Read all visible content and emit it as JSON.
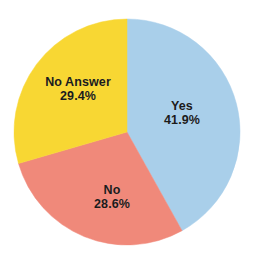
{
  "chart_data": {
    "type": "pie",
    "title": "",
    "subtitle": "",
    "xlabel": "",
    "ylabel": "",
    "grid": false,
    "legend": "none",
    "labels_inside_slices": true,
    "start_angle_deg": 0,
    "direction": "clockwise",
    "categories": [
      "Yes",
      "No",
      "No Answer"
    ],
    "values": [
      41.9,
      28.6,
      29.4
    ],
    "value_unit": "%",
    "slices": [
      {
        "label": "Yes",
        "value": 41.9,
        "value_text": "41.9%",
        "color": "#a9cfea",
        "start_deg": 0.0,
        "end_deg": 150.84,
        "sweep_deg": 150.84
      },
      {
        "label": "No",
        "value": 28.6,
        "value_text": "28.6%",
        "color": "#f0897a",
        "start_deg": 150.84,
        "end_deg": 253.8,
        "sweep_deg": 102.96
      },
      {
        "label": "No Answer",
        "value": 29.4,
        "value_text": "29.4%",
        "color": "#f8d733",
        "start_deg": 253.8,
        "end_deg": 360.0,
        "sweep_deg": 106.2
      }
    ],
    "geometry": {
      "center_x": 127,
      "center_y": 132,
      "radius": 113
    },
    "colors": {
      "yes": "#a9cfea",
      "no": "#f0897a",
      "no_answer": "#f8d733",
      "label_text": "#1b1b1b",
      "background": "#ffffff"
    }
  }
}
